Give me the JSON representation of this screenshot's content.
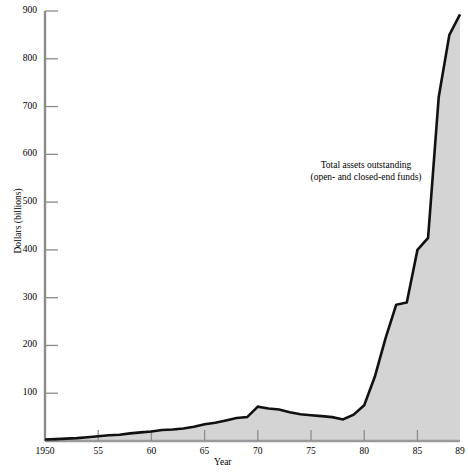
{
  "chart_data": {
    "type": "area",
    "title": "",
    "xlabel": "Year",
    "ylabel": "Dollars (billions)",
    "xlim": [
      1950,
      1989
    ],
    "ylim": [
      0,
      900
    ],
    "grid": false,
    "legend_position": "none",
    "annotations": [
      {
        "name": "series-annotation",
        "line1": "Total assets outstanding",
        "line2": "(open- and closed-end funds)"
      }
    ],
    "xticks": [
      {
        "value": 1950,
        "label": "1950"
      },
      {
        "value": 1955,
        "label": "55"
      },
      {
        "value": 1960,
        "label": "60"
      },
      {
        "value": 1965,
        "label": "65"
      },
      {
        "value": 1970,
        "label": "70"
      },
      {
        "value": 1975,
        "label": "75"
      },
      {
        "value": 1980,
        "label": "80"
      },
      {
        "value": 1985,
        "label": "85"
      },
      {
        "value": 1989,
        "label": "89"
      }
    ],
    "yticks": [
      {
        "value": 0,
        "label": ""
      },
      {
        "value": 100,
        "label": "100"
      },
      {
        "value": 200,
        "label": "200"
      },
      {
        "value": 300,
        "label": "300"
      },
      {
        "value": 400,
        "label": "400"
      },
      {
        "value": 500,
        "label": "500"
      },
      {
        "value": 600,
        "label": "600"
      },
      {
        "value": 700,
        "label": "700"
      },
      {
        "value": 800,
        "label": "800"
      },
      {
        "value": 900,
        "label": "900"
      }
    ],
    "series": [
      {
        "name": "Total assets outstanding (open- and closed-end funds)",
        "x": [
          1950,
          1951,
          1952,
          1953,
          1954,
          1955,
          1956,
          1957,
          1958,
          1959,
          1960,
          1961,
          1962,
          1963,
          1964,
          1965,
          1966,
          1967,
          1968,
          1969,
          1970,
          1971,
          1972,
          1973,
          1974,
          1975,
          1976,
          1977,
          1978,
          1979,
          1980,
          1981,
          1982,
          1983,
          1984,
          1985,
          1986,
          1987,
          1988,
          1989
        ],
        "values": [
          3,
          4,
          5,
          6,
          8,
          10,
          12,
          13,
          16,
          18,
          20,
          23,
          24,
          26,
          30,
          35,
          38,
          43,
          48,
          50,
          72,
          68,
          66,
          60,
          56,
          54,
          52,
          50,
          45,
          55,
          75,
          135,
          215,
          285,
          290,
          400,
          425,
          720,
          850,
          893
        ],
        "line_color": "#111111",
        "fill_color": "#d4d4d4"
      }
    ],
    "colors": {
      "axis": "#8c8c8c",
      "line": "#111111",
      "fill": "#d4d4d4",
      "text": "#000000",
      "background": "#ffffff"
    }
  }
}
